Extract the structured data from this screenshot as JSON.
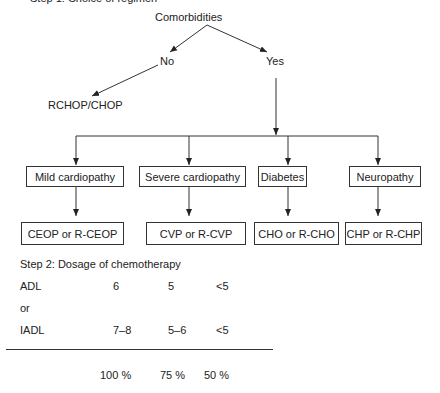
{
  "header": {
    "partial_title": "Step 1: Choice of regimen"
  },
  "tree": {
    "root": "Comorbidities",
    "no_branch": {
      "label": "No",
      "result": "RCHOP/CHOP"
    },
    "yes_branch": {
      "label": "Yes",
      "conditions": [
        {
          "label": "Mild cardiopathy",
          "regimen": "CEOP or R-CEOP"
        },
        {
          "label": "Severe cardiopathy",
          "regimen": "CVP or R-CVP"
        },
        {
          "label": "Diabetes",
          "regimen": "CHO or R-CHO"
        },
        {
          "label": "Neuropathy",
          "regimen": "CHP or R-CHP"
        }
      ]
    }
  },
  "dosage": {
    "title": "Step 2: Dosage of chemotherapy",
    "rows": [
      {
        "label": "ADL",
        "values": [
          "6",
          "5",
          "<5"
        ]
      },
      {
        "label": "or",
        "values": []
      },
      {
        "label": "IADL",
        "values": [
          "7–8",
          "5–6",
          "<5"
        ]
      }
    ],
    "doses": [
      "100 %",
      "75 %",
      "50 %"
    ]
  }
}
